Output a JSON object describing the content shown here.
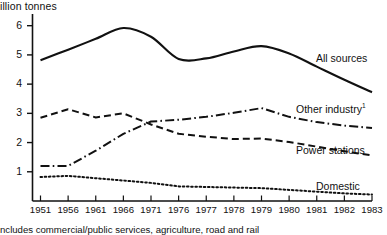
{
  "chart_data": {
    "type": "line",
    "title": "",
    "ylabel": "illion tonnes",
    "xlabel": "",
    "ylim": [
      0,
      6.4
    ],
    "yticks": [
      0,
      1,
      2,
      3,
      4,
      5,
      6
    ],
    "ytick_labels": [
      "0",
      "1",
      "2",
      "3",
      "4",
      "5",
      "6"
    ],
    "grid": false,
    "legend_position": "right-inline",
    "categories": [
      "1951",
      "1956",
      "1961",
      "1966",
      "1971",
      "1976",
      "1977",
      "1978",
      "1979",
      "1980",
      "1981",
      "1982",
      "1983"
    ],
    "xtick_labels": [
      "1951",
      "1956",
      "1961",
      "1966",
      "1971",
      "1976",
      "1977",
      "1978",
      "1979",
      "1980",
      "1981",
      "1982",
      "1983"
    ],
    "series": [
      {
        "name": "All sources",
        "style": "solid",
        "values": [
          4.82,
          5.18,
          5.55,
          5.92,
          5.62,
          4.86,
          4.88,
          5.12,
          5.3,
          5.05,
          4.6,
          4.15,
          3.72
        ]
      },
      {
        "name": "Other industry",
        "style": "dash-dot",
        "footnote_marker": "1",
        "values": [
          1.2,
          1.2,
          1.72,
          2.3,
          2.72,
          2.78,
          2.88,
          3.02,
          3.18,
          2.88,
          2.7,
          2.58,
          2.5
        ]
      },
      {
        "name": "Power stations",
        "style": "dashed",
        "values": [
          2.85,
          3.14,
          2.86,
          3.0,
          2.62,
          2.3,
          2.2,
          2.12,
          2.14,
          2.02,
          1.86,
          1.7,
          1.56
        ]
      },
      {
        "name": "Domestic",
        "style": "dotted",
        "values": [
          0.82,
          0.86,
          0.78,
          0.7,
          0.62,
          0.5,
          0.48,
          0.46,
          0.44,
          0.38,
          0.32,
          0.26,
          0.22
        ]
      }
    ],
    "annotations": {
      "footnote": "ncludes commercial/public services, agriculture, road and rail",
      "footnote_marker": "1"
    }
  },
  "labels": {
    "all_sources": "All sources",
    "other_industry": "Other industry",
    "power_stations": "Power stations",
    "domestic": "Domestic",
    "other_industry_sup": "1",
    "footnote_sup": "1"
  }
}
